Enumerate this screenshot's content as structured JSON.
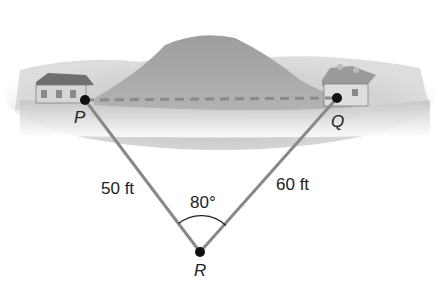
{
  "points": {
    "P": {
      "label": "P"
    },
    "Q": {
      "label": "Q"
    },
    "R": {
      "label": "R"
    }
  },
  "sides": {
    "PR": {
      "label": "50 ft"
    },
    "QR": {
      "label": "60 ft"
    }
  },
  "angle": {
    "label": "80°"
  },
  "colors": {
    "line": "#888888",
    "dash": "#8a8a8a",
    "dot": "#111111",
    "hill": "#9a9a9a"
  }
}
